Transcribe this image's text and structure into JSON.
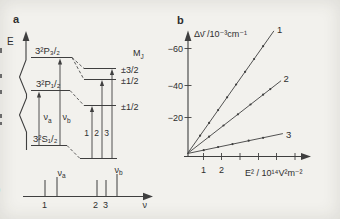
{
  "figure_labels": {
    "panel_a": "a",
    "panel_b": "b"
  },
  "panel_a": {
    "energy_axis_label": "E",
    "level_p32": "3²P₃/₂",
    "level_p12": "3²P₁/₂",
    "level_s12": "3²S₁/₂",
    "mj": {
      "main": "M",
      "sub": "J"
    },
    "mj_values": [
      "±3/2",
      "±1/2",
      "±1/2"
    ],
    "nu_a": {
      "main": "ν",
      "sub": "a"
    },
    "nu_b": {
      "main": "ν",
      "sub": "b"
    },
    "transition_numbers": [
      "1",
      "2",
      "3"
    ],
    "spectrum": {
      "axis_label": "ν",
      "labels_below": [
        "1",
        "2",
        "3"
      ],
      "nu_a": {
        "main": "ν",
        "sub": "a"
      },
      "nu_b": {
        "main": "ν",
        "sub": "b"
      }
    }
  },
  "panel_b": {
    "y_axis_label": "Δν̄ /10⁻³cm⁻¹",
    "x_axis_label": "E² / 10¹⁴V²m⁻²"
  },
  "chart_data": {
    "type": "line",
    "xlabel": "E² / 10¹⁴V²m⁻²",
    "ylabel": "Δν̄ /10⁻³cm⁻¹",
    "x_tick_labels": [
      "1",
      "2"
    ],
    "x_ticks_shown": [
      1,
      2,
      3,
      4,
      5,
      6
    ],
    "y_tick_labels": [
      "−60",
      "−40",
      "−20"
    ],
    "y_tick_values": [
      60,
      40,
      20
    ],
    "legend_position": "line-end-labels",
    "grid": false,
    "series": [
      {
        "label": "1",
        "slope": 14.6,
        "line_end_E2": 4.8,
        "E2": [
          0.7,
          1.2,
          1.7,
          2.2,
          2.7,
          3.2,
          3.7,
          4.2
        ],
        "delta_nu": [
          10.2,
          17.5,
          24.8,
          32.1,
          39.4,
          46.7,
          54.0,
          61.3
        ]
      },
      {
        "label": "2",
        "slope": 8.0,
        "line_end_E2": 5.2,
        "E2": [
          1.2,
          2.0,
          2.8,
          3.5,
          4.2,
          4.6
        ],
        "delta_nu": [
          9.6,
          16.0,
          22.4,
          28.0,
          33.6,
          36.8
        ]
      },
      {
        "label": "3",
        "slope": 2.15,
        "line_end_E2": 5.3,
        "E2": [
          0.9,
          1.7,
          2.5,
          3.4,
          4.2
        ],
        "delta_nu": [
          1.9,
          3.7,
          5.4,
          7.3,
          9.0
        ]
      }
    ]
  },
  "page_edge_fragment": ")"
}
